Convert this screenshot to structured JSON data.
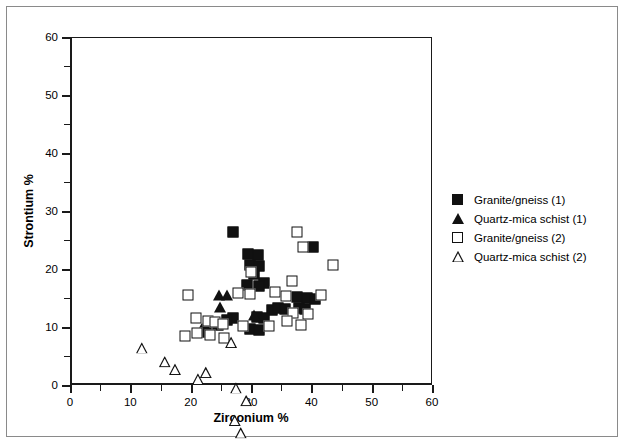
{
  "chart_data": {
    "type": "scatter",
    "title": "",
    "xlabel": "Zirconium %",
    "ylabel": "Strontium %",
    "xlim": [
      0,
      60
    ],
    "ylim": [
      0,
      60
    ],
    "xticks": [
      0,
      10,
      20,
      30,
      40,
      50,
      60
    ],
    "yticks": [
      0,
      10,
      20,
      30,
      40,
      50,
      60
    ],
    "xminorticks": [
      5,
      15,
      25,
      35,
      45,
      55
    ],
    "yminorticks": [
      5,
      15,
      25,
      35,
      45,
      55
    ],
    "xticklabels": [
      "0",
      "10",
      "20",
      "30",
      "40",
      "50",
      "60"
    ],
    "yticklabels": [
      "0",
      "10",
      "20",
      "30",
      "40",
      "50",
      "60"
    ],
    "grid": false,
    "legend_position": "right",
    "series": [
      {
        "name": "Granite/gneiss (1)",
        "marker": "filled-square",
        "points": [
          [
            27.0,
            26.4
          ],
          [
            29.5,
            22.6
          ],
          [
            31.2,
            22.4
          ],
          [
            29.8,
            20.7
          ],
          [
            31.4,
            20.6
          ],
          [
            30.5,
            19.2
          ],
          [
            40.3,
            23.8
          ],
          [
            32.2,
            17.6
          ],
          [
            29.4,
            17.3
          ],
          [
            31.4,
            17.1
          ],
          [
            37.7,
            15.2
          ],
          [
            39.3,
            15.0
          ],
          [
            40.6,
            14.9
          ],
          [
            38.0,
            13.3
          ],
          [
            38.9,
            13.1
          ],
          [
            33.5,
            13.0
          ],
          [
            34.5,
            13.2
          ],
          [
            35.7,
            13.1
          ],
          [
            31.0,
            11.8
          ],
          [
            32.1,
            11.6
          ],
          [
            27.0,
            11.6
          ],
          [
            26.0,
            11.2
          ],
          [
            24.5,
            10.4
          ],
          [
            29.9,
            9.6
          ],
          [
            31.3,
            9.5
          ],
          [
            22.6,
            9.1
          ]
        ]
      },
      {
        "name": "Quartz-mica schist (1)",
        "marker": "filled-triangle",
        "points": [
          [
            24.7,
            15.6
          ],
          [
            26.0,
            15.5
          ],
          [
            24.9,
            13.4
          ],
          [
            30.5,
            12.0
          ],
          [
            21.8,
            9.8
          ]
        ]
      },
      {
        "name": "Granite/gneiss (2)",
        "marker": "open-square",
        "points": [
          [
            37.6,
            26.4
          ],
          [
            38.6,
            23.8
          ],
          [
            43.6,
            20.7
          ],
          [
            30.0,
            19.5
          ],
          [
            36.8,
            18.0
          ],
          [
            33.9,
            16.0
          ],
          [
            41.6,
            15.6
          ],
          [
            27.8,
            15.8
          ],
          [
            29.9,
            15.7
          ],
          [
            19.5,
            15.5
          ],
          [
            35.8,
            15.4
          ],
          [
            37.0,
            12.5
          ],
          [
            39.4,
            12.2
          ],
          [
            36.0,
            11.1
          ],
          [
            38.3,
            10.4
          ],
          [
            33.0,
            10.2
          ],
          [
            20.9,
            11.5
          ],
          [
            22.8,
            11.1
          ],
          [
            24.0,
            10.8
          ],
          [
            25.4,
            10.6
          ],
          [
            28.6,
            10.2
          ],
          [
            21.0,
            8.9
          ],
          [
            23.2,
            8.6
          ],
          [
            25.6,
            8.1
          ],
          [
            19.1,
            8.4
          ]
        ]
      },
      {
        "name": "Quartz-mica schist (2)",
        "marker": "open-triangle",
        "points": [
          [
            11.9,
            6.4
          ],
          [
            15.7,
            6.0
          ],
          [
            17.4,
            6.7
          ],
          [
            21.2,
            7.0
          ],
          [
            26.7,
            15.3
          ],
          [
            22.5,
            12.1
          ],
          [
            27.5,
            11.4
          ],
          [
            29.2,
            11.2
          ],
          [
            27.3,
            9.8
          ],
          [
            28.3,
            9.6
          ],
          [
            26.8,
            8.6
          ],
          [
            27.9,
            7.4
          ],
          [
            29.3,
            7.5
          ],
          [
            26.5,
            6.9
          ],
          [
            28.6,
            6.5
          ]
        ]
      }
    ]
  },
  "legend": {
    "items": [
      {
        "label": "Granite/gneiss (1)",
        "marker": "filled-square"
      },
      {
        "label": "Quartz-mica schist (1)",
        "marker": "filled-triangle"
      },
      {
        "label": "Granite/gneiss (2)",
        "marker": "open-square"
      },
      {
        "label": "Quartz-mica schist (2)",
        "marker": "open-triangle"
      }
    ]
  }
}
